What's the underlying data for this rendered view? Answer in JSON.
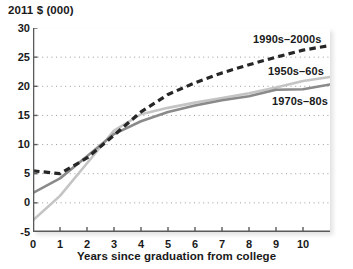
{
  "chart_data": {
    "type": "line",
    "title": "",
    "subtitle": "",
    "ylabel": "2011 $ (000)",
    "xlabel": "Years since graduation from college",
    "x": [
      0,
      1,
      2,
      3,
      4,
      5,
      6,
      7,
      8,
      9,
      10,
      11
    ],
    "xlim": [
      0,
      11
    ],
    "ylim": [
      -5,
      30
    ],
    "xticks": [
      "0",
      "1",
      "2",
      "3",
      "4",
      "5",
      "6",
      "7",
      "8",
      "9",
      "10"
    ],
    "xtick_values": [
      0,
      1,
      2,
      3,
      4,
      5,
      6,
      7,
      8,
      9,
      10
    ],
    "yticks": [
      "30",
      "25",
      "20",
      "15",
      "10",
      "5",
      "0",
      "-5"
    ],
    "ytick_values": [
      30,
      25,
      20,
      15,
      10,
      5,
      0,
      -5
    ],
    "grid": "horizontal-dotted",
    "legend_position": "inline-annotations",
    "series": [
      {
        "name": "1990s-2000s",
        "label": "1990s–2000s",
        "style": "dashed",
        "color": "#262626",
        "values": [
          5.5,
          5.0,
          7.7,
          11.6,
          15.6,
          18.6,
          20.6,
          22.3,
          23.7,
          25.0,
          26.2,
          27.0
        ]
      },
      {
        "name": "1950s-60s",
        "label": "1950s–60s",
        "style": "solid",
        "color": "#c4c4c4",
        "values": [
          -3.0,
          1.2,
          6.8,
          12.4,
          15.2,
          16.3,
          17.2,
          18.0,
          18.8,
          19.8,
          20.9,
          21.6
        ]
      },
      {
        "name": "1970s-80s",
        "label": "1970s–80s",
        "style": "solid",
        "color": "#8a8a8a",
        "values": [
          1.7,
          4.2,
          8.0,
          11.8,
          14.0,
          15.6,
          16.7,
          17.6,
          18.3,
          19.4,
          19.5,
          20.3
        ]
      }
    ]
  }
}
